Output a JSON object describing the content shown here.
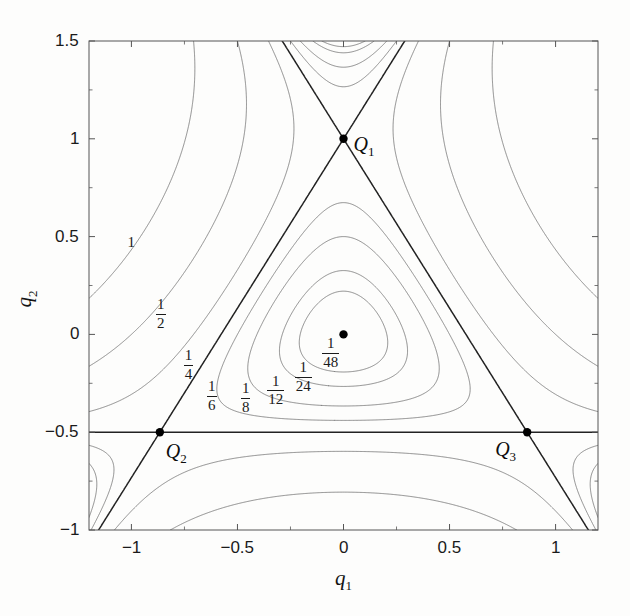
{
  "figure": {
    "kind": "contour-plot",
    "background_color": "#fdfdfc",
    "axis_color": "#555555",
    "contour_color": "#777777",
    "separatrix_color": "#222222",
    "marker_color": "#000000"
  },
  "axes": {
    "x_title": "q",
    "x_title_sub": "1",
    "y_title": "q",
    "y_title_sub": "2",
    "x_ticks": [
      "-1",
      "-0.5",
      "0",
      "0.5",
      "1"
    ],
    "y_ticks": [
      "1.5",
      "1",
      "0.5",
      "0",
      "-0.5",
      "-1"
    ]
  },
  "points": [
    {
      "name": "Q1",
      "label": "Q",
      "sub": "1",
      "x": 0.0,
      "y": 1.0
    },
    {
      "name": "Q2",
      "label": "Q",
      "sub": "2",
      "x": -0.866,
      "y": -0.5
    },
    {
      "name": "Q3",
      "label": "Q",
      "sub": "3",
      "x": 0.866,
      "y": -0.5
    },
    {
      "name": "minimum",
      "label": "",
      "sub": "",
      "x": 0.0,
      "y": 0.0
    }
  ],
  "contour_labels": [
    {
      "text": "1",
      "num": "1",
      "den": "",
      "x": -1.0,
      "y": 0.47
    },
    {
      "text": "1/2",
      "num": "1",
      "den": "2",
      "x": -0.86,
      "y": 0.1
    },
    {
      "text": "1/4",
      "num": "1",
      "den": "4",
      "x": -0.73,
      "y": -0.16
    },
    {
      "text": "1/6",
      "num": "1",
      "den": "6",
      "x": -0.62,
      "y": -0.32
    },
    {
      "text": "1/8",
      "num": "1",
      "den": "8",
      "x": -0.46,
      "y": -0.33
    },
    {
      "text": "1/12",
      "num": "1",
      "den": "12",
      "x": -0.32,
      "y": -0.29
    },
    {
      "text": "1/24",
      "num": "1",
      "den": "24",
      "x": -0.19,
      "y": -0.22
    },
    {
      "text": "1/48",
      "num": "1",
      "den": "48",
      "x": -0.06,
      "y": -0.1
    }
  ],
  "chart_data": {
    "type": "contour",
    "title": "",
    "xlabel": "q1",
    "ylabel": "q2",
    "xlim": [
      -1.2,
      1.2
    ],
    "ylim": [
      -1.0,
      1.5
    ],
    "grid": false,
    "legend": "none",
    "function": "V(q1,q2) = 0.5*(q1^2 + q2^2) + q1^2*q2 - q2^3/3",
    "contour_levels": [
      0.0208333,
      0.0416667,
      0.0833333,
      0.125,
      0.1666667,
      0.25,
      0.5,
      1.0
    ],
    "contour_level_labels": [
      "1/48",
      "1/24",
      "1/12",
      "1/8",
      "1/6",
      "1/4",
      "1/2",
      "1"
    ],
    "separatrix_level": 0.1666667,
    "separatrix_level_label": "1/6",
    "critical_points": [
      {
        "label": "minimum",
        "x": 0.0,
        "y": 0.0,
        "value": 0.0,
        "type": "minimum"
      },
      {
        "label": "Q1",
        "x": 0.0,
        "y": 1.0,
        "value": 0.1666667,
        "type": "saddle"
      },
      {
        "label": "Q2",
        "x": -0.866,
        "y": -0.5,
        "value": 0.1666667,
        "type": "saddle"
      },
      {
        "label": "Q3",
        "x": 0.866,
        "y": -0.5,
        "value": 0.1666667,
        "type": "saddle"
      }
    ],
    "annotations": [
      "Q1",
      "Q2",
      "Q3",
      "1",
      "1/2",
      "1/4",
      "1/6",
      "1/8",
      "1/12",
      "1/24",
      "1/48"
    ]
  }
}
